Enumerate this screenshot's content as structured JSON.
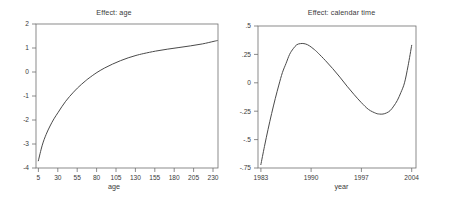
{
  "figure": {
    "panel_count": 2,
    "background": "#ffffff",
    "line_color": "#4a4a4a",
    "axis_color": "#6e6e6e"
  },
  "panels": {
    "age": {
      "title": "Effect: age",
      "xlabel": "age",
      "ylabel": "",
      "xticks": [
        "5",
        "30",
        "55",
        "80",
        "105",
        "130",
        "155",
        "180",
        "205",
        "230"
      ],
      "yticks": [
        "2",
        "1",
        "0",
        "-1",
        "-2",
        "-3",
        "-4"
      ]
    },
    "time": {
      "title": "Effect: calendar time",
      "xlabel": "year",
      "ylabel": "",
      "xticks": [
        "1983",
        "1990",
        "1997",
        "2004"
      ],
      "yticks": [
        ".5",
        ".25",
        "0",
        "-.25",
        "-.5",
        "-.75"
      ]
    }
  },
  "chart_data": [
    {
      "type": "line",
      "title": "Effect: age",
      "xlabel": "age",
      "ylabel": "",
      "xlim": [
        2,
        235
      ],
      "ylim": [
        -4,
        2
      ],
      "xticks": [
        5,
        30,
        55,
        80,
        105,
        130,
        155,
        180,
        205,
        230
      ],
      "yticks": [
        2,
        1,
        0,
        -1,
        -2,
        -3,
        -4
      ],
      "grid": false,
      "legend": false,
      "series": [
        {
          "name": "Effect: age",
          "x": [
            5,
            10,
            15,
            20,
            25,
            30,
            35,
            40,
            45,
            50,
            55,
            60,
            65,
            70,
            80,
            90,
            100,
            110,
            120,
            130,
            140,
            155,
            170,
            185,
            200,
            215,
            230,
            234
          ],
          "y": [
            -3.7,
            -3.05,
            -2.6,
            -2.25,
            -1.95,
            -1.7,
            -1.45,
            -1.22,
            -1.02,
            -0.84,
            -0.67,
            -0.52,
            -0.38,
            -0.25,
            -0.02,
            0.17,
            0.33,
            0.47,
            0.59,
            0.69,
            0.77,
            0.87,
            0.95,
            1.02,
            1.09,
            1.17,
            1.28,
            1.31
          ]
        }
      ]
    },
    {
      "type": "line",
      "title": "Effect: calendar time",
      "xlabel": "year",
      "ylabel": "",
      "xlim": [
        1982.6,
        2004.6
      ],
      "ylim": [
        -0.75,
        0.5
      ],
      "xticks": [
        1983,
        1990,
        1997,
        2004
      ],
      "yticks": [
        0.5,
        0.25,
        0,
        -0.25,
        -0.5,
        -0.75
      ],
      "grid": false,
      "legend": false,
      "series": [
        {
          "name": "Effect: calendar time",
          "x": [
            1983.0,
            1983.5,
            1984.0,
            1984.5,
            1985.0,
            1985.5,
            1986.0,
            1986.5,
            1987.0,
            1987.5,
            1988.0,
            1988.5,
            1989.0,
            1989.5,
            1990.0,
            1990.5,
            1991.0,
            1992.0,
            1993.0,
            1994.0,
            1995.0,
            1996.0,
            1997.0,
            1998.0,
            1999.0,
            1999.5,
            2000.0,
            2000.5,
            2001.0,
            2001.5,
            2002.0,
            2002.5,
            2003.0,
            2003.5,
            2004.0
          ],
          "y": [
            -0.72,
            -0.56,
            -0.41,
            -0.27,
            -0.14,
            -0.02,
            0.09,
            0.17,
            0.25,
            0.3,
            0.335,
            0.345,
            0.345,
            0.335,
            0.315,
            0.29,
            0.26,
            0.195,
            0.125,
            0.05,
            -0.03,
            -0.105,
            -0.175,
            -0.235,
            -0.268,
            -0.275,
            -0.275,
            -0.265,
            -0.245,
            -0.205,
            -0.155,
            -0.085,
            0.0,
            0.15,
            0.33
          ]
        }
      ]
    }
  ]
}
